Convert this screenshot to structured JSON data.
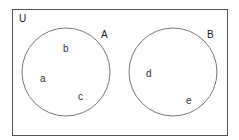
{
  "diagram": {
    "type": "venn",
    "universe": {
      "label": "U",
      "rect": {
        "x": 12.5,
        "y": 9.5,
        "width": 215,
        "height": 126
      },
      "stroke": "#555555",
      "label_pos": {
        "x": 19,
        "y": 22
      }
    },
    "sets": [
      {
        "name": "A",
        "circle": {
          "cx": 66,
          "cy": 72,
          "r": 44
        },
        "stroke": "#777777",
        "label_pos": {
          "x": 101,
          "y": 38
        },
        "elements": [
          {
            "label": "b",
            "x": 63,
            "y": 52
          },
          {
            "label": "a",
            "x": 40,
            "y": 82
          },
          {
            "label": "c",
            "x": 78,
            "y": 100
          }
        ]
      },
      {
        "name": "B",
        "circle": {
          "cx": 173,
          "cy": 72,
          "r": 44
        },
        "stroke": "#777777",
        "label_pos": {
          "x": 207,
          "y": 38
        },
        "elements": [
          {
            "label": "d",
            "x": 146,
            "y": 77
          },
          {
            "label": "e",
            "x": 186,
            "y": 104
          }
        ]
      }
    ]
  }
}
